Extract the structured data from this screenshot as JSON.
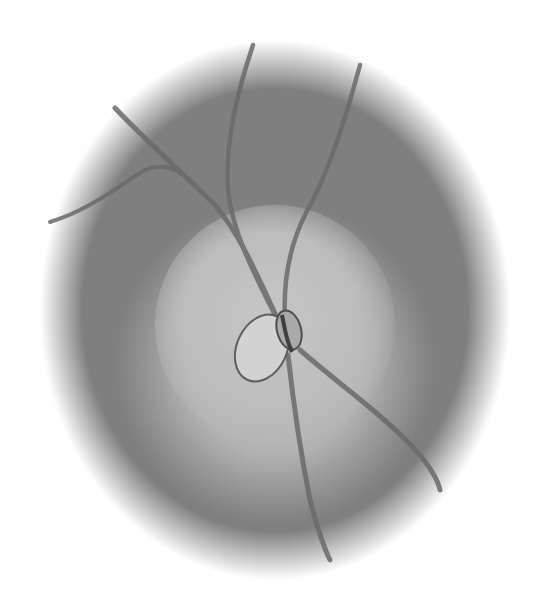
{
  "image": {
    "subject": "grayscale retinal fundus rendering",
    "elements": [
      "circular-fundus-field",
      "bright-central-region",
      "optic-disc",
      "blood-vessels"
    ],
    "colors": {
      "background": "#ffffff",
      "outer_field": "#7d7d7d",
      "center_glow": "#bcbcbc",
      "vessel": "#6a6a6a",
      "disc_fill": "#cfcfcf",
      "disc_outline": "#555555"
    }
  }
}
